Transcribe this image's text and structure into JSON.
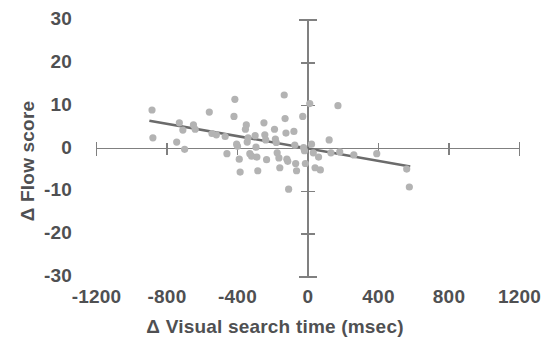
{
  "chart_data": {
    "type": "scatter",
    "title": "",
    "xlabel": "Δ Visual search time (msec)",
    "ylabel": "Δ Flow score",
    "xlim": [
      -1200,
      1200
    ],
    "ylim": [
      -30,
      30
    ],
    "xticks": [
      -1200,
      -800,
      -400,
      0,
      400,
      800,
      1200
    ],
    "yticks": [
      30,
      20,
      10,
      0,
      -10,
      -20,
      -30
    ],
    "xtick_labels": [
      "-1200",
      "-800",
      "-400",
      "0",
      "400",
      "800",
      "1200"
    ],
    "ytick_labels": [
      "30",
      "20",
      "10",
      "0",
      "-10",
      "-20",
      "-30"
    ],
    "grid": false,
    "legend": null,
    "point_color": "#b3b3b3",
    "trendline_color": "#6b6b6b",
    "axis_color": "#808080",
    "series": [
      {
        "name": "participants",
        "marker": "circle",
        "points": [
          [
            -885,
            9.0
          ],
          [
            -880,
            2.5
          ],
          [
            -745,
            1.5
          ],
          [
            -730,
            6.0
          ],
          [
            -710,
            4.3
          ],
          [
            -700,
            -0.2
          ],
          [
            -650,
            5.5
          ],
          [
            -640,
            4.5
          ],
          [
            -560,
            8.5
          ],
          [
            -545,
            3.5
          ],
          [
            -520,
            3.2
          ],
          [
            -470,
            2.8
          ],
          [
            -460,
            -1.2
          ],
          [
            -420,
            7.5
          ],
          [
            -415,
            11.5
          ],
          [
            -405,
            1.0
          ],
          [
            -400,
            0.5
          ],
          [
            -390,
            -2.5
          ],
          [
            -385,
            -5.5
          ],
          [
            -355,
            4.5
          ],
          [
            -350,
            5.5
          ],
          [
            -345,
            1.5
          ],
          [
            -340,
            2.5
          ],
          [
            -330,
            -1.2
          ],
          [
            -320,
            -1.8
          ],
          [
            -300,
            3.0
          ],
          [
            -295,
            0.3
          ],
          [
            -290,
            -2.0
          ],
          [
            -285,
            -5.2
          ],
          [
            -250,
            6.0
          ],
          [
            -245,
            3.2
          ],
          [
            -240,
            2.0
          ],
          [
            -235,
            -2.6
          ],
          [
            -190,
            4.5
          ],
          [
            -185,
            2.2
          ],
          [
            -180,
            1.4
          ],
          [
            -175,
            -1.0
          ],
          [
            -165,
            -2.2
          ],
          [
            -160,
            -4.5
          ],
          [
            -135,
            12.5
          ],
          [
            -130,
            7.0
          ],
          [
            -125,
            3.6
          ],
          [
            -120,
            -2.5
          ],
          [
            -115,
            -3.0
          ],
          [
            -110,
            -9.5
          ],
          [
            -80,
            4.0
          ],
          [
            -75,
            0.8
          ],
          [
            -70,
            -3.5
          ],
          [
            -65,
            -5.2
          ],
          [
            -30,
            7.5
          ],
          [
            -25,
            0.2
          ],
          [
            -20,
            -0.5
          ],
          [
            -15,
            -3.5
          ],
          [
            10,
            10.5
          ],
          [
            20,
            1.0
          ],
          [
            30,
            -1.0
          ],
          [
            40,
            -4.5
          ],
          [
            60,
            -2.0
          ],
          [
            70,
            -5.0
          ],
          [
            120,
            2.0
          ],
          [
            130,
            -1.0
          ],
          [
            170,
            10.0
          ],
          [
            180,
            -0.8
          ],
          [
            260,
            -1.5
          ],
          [
            390,
            -1.2
          ],
          [
            560,
            -4.8
          ],
          [
            575,
            -9.0
          ]
        ]
      }
    ],
    "trendline": {
      "type": "linear",
      "x_start": -900,
      "y_start": 6.5,
      "x_end": 580,
      "y_end": -4.2,
      "slope": -0.00723,
      "intercept": -0.0
    }
  },
  "axis_titles": {
    "x": "Δ Visual search time (msec)",
    "y": "Δ Flow score"
  }
}
